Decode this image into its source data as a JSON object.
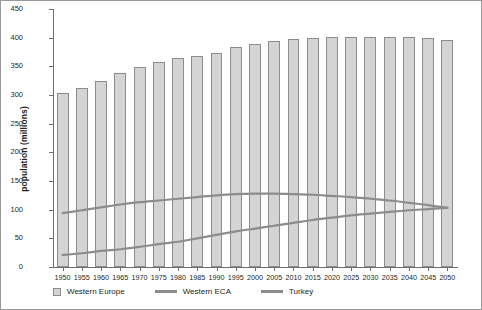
{
  "chart_data": {
    "type": "bar",
    "title": "",
    "xlabel": "",
    "ylabel": "population (millions)",
    "ylim": [
      0,
      450
    ],
    "ytick_step": 50,
    "yticks": [
      "450",
      "400",
      "350",
      "300",
      "250",
      "200",
      "150",
      "100",
      "50",
      "0"
    ],
    "grid": false,
    "legend_position": "bottom",
    "categories": [
      "1950",
      "1955",
      "1960",
      "1965",
      "1970",
      "1975",
      "1980",
      "1985",
      "1990",
      "1995",
      "2000",
      "2005",
      "2010",
      "2015",
      "2020",
      "2025",
      "2030",
      "2035",
      "2040",
      "2045",
      "2050"
    ],
    "series": [
      {
        "name": "Western Europe",
        "render": "bar",
        "color": "#d4d4d4",
        "edge_color": "#8c8c8c",
        "values": [
          304,
          313,
          324,
          339,
          349,
          357,
          364,
          368,
          374,
          383,
          389,
          395,
          398,
          400,
          401,
          402,
          402,
          402,
          401,
          399,
          396
        ]
      },
      {
        "name": "Western ECA",
        "render": "line",
        "color": "#8c8c8c",
        "values": [
          94,
          99,
          104,
          109,
          113,
          116,
          119,
          122,
          125,
          127,
          128,
          128,
          127,
          126,
          124,
          122,
          119,
          116,
          112,
          108,
          103
        ]
      },
      {
        "name": "Turkey",
        "render": "line",
        "color": "#8c8c8c",
        "values": [
          21,
          24,
          28,
          31,
          35,
          40,
          44,
          50,
          56,
          62,
          67,
          72,
          77,
          82,
          86,
          90,
          93,
          96,
          99,
          101,
          103
        ]
      }
    ]
  },
  "legend": {
    "items": [
      {
        "label": "Western Europe",
        "marker": "swatch"
      },
      {
        "label": "Western ECA",
        "marker": "line"
      },
      {
        "label": "Turkey",
        "marker": "line"
      }
    ]
  },
  "axis": {
    "y_title": "population (millions)"
  }
}
